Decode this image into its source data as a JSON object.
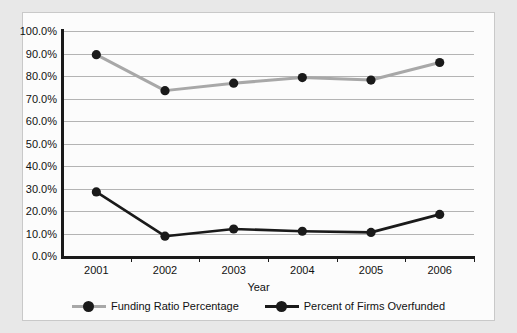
{
  "chart_data": {
    "type": "line",
    "title": "",
    "xlabel": "Year",
    "ylabel": "",
    "categories": [
      "2001",
      "2002",
      "2003",
      "2004",
      "2005",
      "2006"
    ],
    "ylim": [
      0,
      100
    ],
    "ytick_labels": [
      "100.0%",
      "90.0%",
      "80.0%",
      "70.0%",
      "60.0%",
      "50.0%",
      "40.0%",
      "30.0%",
      "20.0%",
      "10.0%",
      "0.0%"
    ],
    "ytick_values": [
      100,
      90,
      80,
      70,
      60,
      50,
      40,
      30,
      20,
      10,
      0
    ],
    "grid": true,
    "legend_position": "bottom",
    "series": [
      {
        "name": "Funding Ratio Percentage",
        "color": "#a8a8a8",
        "marker_color": "#1a1a1a",
        "values": [
          89.5,
          73.5,
          76.8,
          79.3,
          78.2,
          86.0
        ]
      },
      {
        "name": "Percent of Firms Overfunded",
        "color": "#1a1a1a",
        "marker_color": "#1a1a1a",
        "values": [
          28.5,
          8.8,
          12.0,
          11.0,
          10.5,
          18.5
        ]
      }
    ]
  }
}
